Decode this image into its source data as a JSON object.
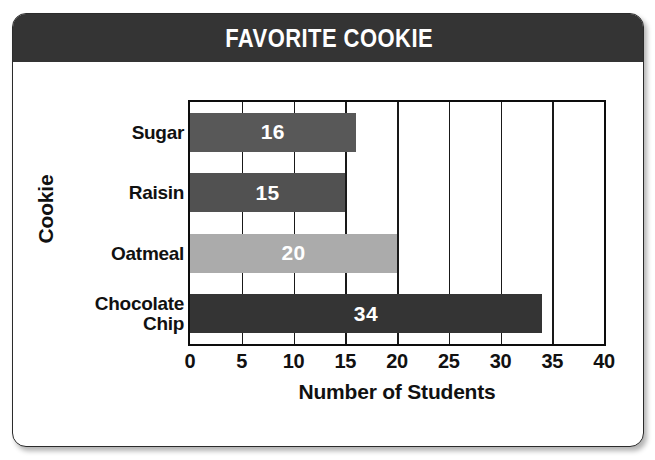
{
  "card": {
    "title": "FAVORITE COOKIE"
  },
  "chart_data": {
    "type": "bar",
    "orientation": "horizontal",
    "title": "FAVORITE COOKIE",
    "xlabel": "Number of Students",
    "ylabel": "Cookie",
    "categories": [
      "Sugar",
      "Raisin",
      "Oatmeal",
      "Chocolate\nChip"
    ],
    "values": [
      16,
      15,
      20,
      34
    ],
    "bar_colors": [
      "#585858",
      "#515151",
      "#ababab",
      "#343434"
    ],
    "value_label_color": "#ffffff",
    "xlim": [
      0,
      40
    ],
    "xticks": [
      0,
      5,
      10,
      15,
      20,
      25,
      30,
      35,
      40
    ],
    "xtick_labels": [
      "0",
      "5",
      "10",
      "15",
      "20",
      "25",
      "30",
      "35",
      "40"
    ],
    "grid": true,
    "grid_axis": "x",
    "grid_color": "#191919",
    "legend": false,
    "plot_border_color": "#0d0d0d",
    "background": "#ffffff",
    "title_bar_color": "#343434",
    "title_text_color": "#ffffff"
  }
}
